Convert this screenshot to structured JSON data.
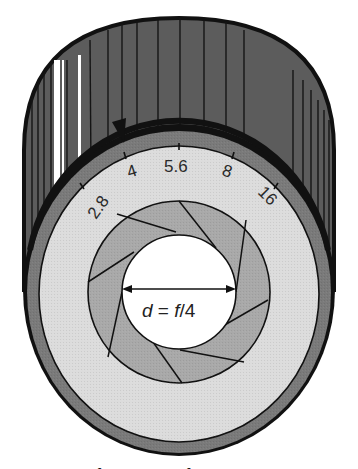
{
  "figure": {
    "colors": {
      "barrel": "#5a5a5a",
      "barrel_rib": "#1a1a1a",
      "barrel_highlight": "#ffffff",
      "outer_ring": "#7a7a7a",
      "scale_ring": "#dcdcdc",
      "iris_blades": "#a8a8a8",
      "aperture": "#ffffff",
      "outline": "#111111"
    },
    "aperture_scale": {
      "stops": [
        "2.8",
        "4",
        "5.6",
        "8",
        "16"
      ],
      "selected": "4"
    },
    "aperture_label": {
      "symbol_d": "d",
      "equals": " = ",
      "symbol_f": "f",
      "divisor": "/4",
      "full": "d = f/4"
    },
    "iris_blade_count": 8,
    "caption_fragment": "Fig. ... The f-number of a lens"
  }
}
